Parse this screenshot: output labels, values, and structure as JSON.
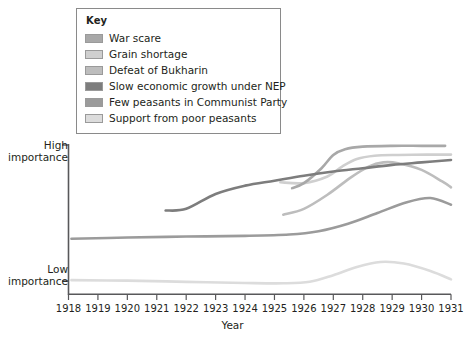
{
  "legend": {
    "title": "Key",
    "items": [
      {
        "label": "War scare",
        "color": "#a8a8a8"
      },
      {
        "label": "Grain shortage",
        "color": "#cfcfcf"
      },
      {
        "label": "Defeat of Bukharin",
        "color": "#bdbdbd"
      },
      {
        "label": "Slow economic growth under NEP",
        "color": "#7d7d7d"
      },
      {
        "label": "Few peasants in Communist Party",
        "color": "#9b9b9b"
      },
      {
        "label": "Support from poor peasants",
        "color": "#dcdcdc"
      }
    ]
  },
  "axes": {
    "y_high_line1": "High",
    "y_high_line2": "importance",
    "y_low_line1": "Low",
    "y_low_line2": "importance",
    "x_title": "Year"
  },
  "chart_data": {
    "type": "line",
    "title": "",
    "xlabel": "Year",
    "ylabel": "Importance",
    "xlim": [
      1918,
      1931
    ],
    "ylim": [
      0,
      10
    ],
    "grid": false,
    "legend_position": "top-left-inside-box",
    "ytick_labels": [
      "Low importance",
      "High importance"
    ],
    "ytick_values": [
      1.0,
      9.2
    ],
    "xtick_labels": [
      "1918",
      "1919",
      "1920",
      "1921",
      "1922",
      "1923",
      "1924",
      "1925",
      "1926",
      "1927",
      "1928",
      "1929",
      "1930",
      "1931"
    ],
    "series": [
      {
        "name": "War scare",
        "color": "#a8a8a8",
        "x": [
          1925.6,
          1926.0,
          1926.6,
          1927.0,
          1927.4,
          1928.0,
          1929.0,
          1930.0,
          1930.8
        ],
        "y": [
          6.6,
          6.9,
          7.8,
          8.6,
          8.95,
          9.1,
          9.15,
          9.15,
          9.15
        ]
      },
      {
        "name": "Grain shortage",
        "color": "#cfcfcf",
        "x": [
          1925.2,
          1926.0,
          1926.8,
          1927.3,
          1927.8,
          1928.4,
          1929.2,
          1930.2,
          1931.0
        ],
        "y": [
          6.95,
          6.9,
          7.3,
          7.9,
          8.35,
          8.55,
          8.6,
          8.62,
          8.62
        ]
      },
      {
        "name": "Defeat of Bukharin",
        "color": "#bdbdbd",
        "x": [
          1925.3,
          1926.0,
          1926.8,
          1927.6,
          1928.2,
          1928.7,
          1929.2,
          1930.0,
          1930.7,
          1931.0
        ],
        "y": [
          5.0,
          5.35,
          6.2,
          7.25,
          7.9,
          8.15,
          8.1,
          7.7,
          7.0,
          6.65
        ]
      },
      {
        "name": "Slow economic growth under NEP",
        "color": "#7d7d7d",
        "x": [
          1921.3,
          1922.0,
          1923.0,
          1924.0,
          1925.0,
          1926.0,
          1927.0,
          1928.0,
          1929.0,
          1930.0,
          1931.0
        ],
        "y": [
          5.25,
          5.35,
          6.25,
          6.75,
          7.05,
          7.35,
          7.6,
          7.8,
          8.0,
          8.15,
          8.3
        ]
      },
      {
        "name": "Few peasants in Communist Party",
        "color": "#9b9b9b",
        "x": [
          1918.1,
          1920.0,
          1922.0,
          1924.0,
          1925.5,
          1926.5,
          1927.5,
          1928.5,
          1929.5,
          1930.3,
          1931.0
        ],
        "y": [
          3.55,
          3.62,
          3.68,
          3.72,
          3.8,
          4.0,
          4.45,
          5.1,
          5.75,
          6.0,
          5.6
        ]
      },
      {
        "name": "Support from poor peasants",
        "color": "#dcdcdc",
        "x": [
          1918.1,
          1920.0,
          1922.0,
          1924.0,
          1925.3,
          1926.2,
          1927.0,
          1927.8,
          1928.6,
          1929.4,
          1930.3,
          1931.0
        ],
        "y": [
          1.05,
          1.02,
          0.95,
          0.88,
          0.86,
          0.95,
          1.35,
          1.85,
          2.15,
          2.05,
          1.6,
          1.1
        ]
      }
    ]
  }
}
